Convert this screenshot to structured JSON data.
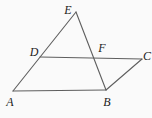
{
  "diagram": {
    "background_color": "#fafafa",
    "line_color": "#5e5e5e",
    "label_color": "#1c1c1c",
    "line_width": 1.1,
    "points": {
      "A": {
        "x": 13,
        "y": 91
      },
      "B": {
        "x": 106,
        "y": 90
      },
      "C": {
        "x": 142,
        "y": 59
      },
      "D": {
        "x": 40,
        "y": 57
      },
      "E": {
        "x": 76,
        "y": 12
      },
      "F": {
        "x": 94,
        "y": 58
      }
    },
    "segments": [
      {
        "from": "A",
        "to": "B"
      },
      {
        "from": "A",
        "to": "E"
      },
      {
        "from": "E",
        "to": "B"
      },
      {
        "from": "D",
        "to": "C"
      },
      {
        "from": "C",
        "to": "B"
      }
    ],
    "labels": [
      {
        "text": "A",
        "x": 10,
        "y": 106
      },
      {
        "text": "B",
        "x": 107,
        "y": 106
      },
      {
        "text": "C",
        "x": 147,
        "y": 60
      },
      {
        "text": "D",
        "x": 34,
        "y": 56
      },
      {
        "text": "E",
        "x": 68,
        "y": 14
      },
      {
        "text": "F",
        "x": 102,
        "y": 52
      }
    ]
  }
}
